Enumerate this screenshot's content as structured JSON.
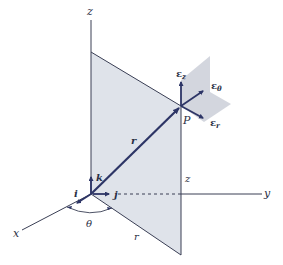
{
  "diagram": {
    "type": "cylindrical-coordinates",
    "colors": {
      "vector": "#2d3566",
      "axis": "#3a3f55",
      "plane": "#dfe3ea",
      "plane_edge": "#3a3f55",
      "small_plane": "#c8ccd6"
    },
    "axes": {
      "x": "x",
      "y": "y",
      "z_top": "z"
    },
    "labels": {
      "point": "P",
      "radius_vector": "r",
      "radius_base": "r",
      "height": "z",
      "angle": "θ",
      "unit_i": "i",
      "unit_j": "j",
      "unit_k": "k",
      "e_z": "ε",
      "e_z_sub": "z",
      "e_theta": "ε",
      "e_theta_sub": "θ",
      "e_r": "ε",
      "e_r_sub": "r"
    }
  }
}
